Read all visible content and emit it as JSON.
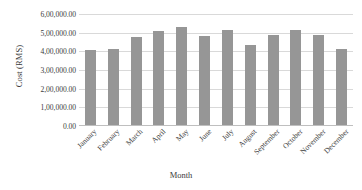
{
  "chart_data": {
    "type": "bar",
    "title": "",
    "xlabel": "Month",
    "ylabel": "Cost (RMS)",
    "categories": [
      "January",
      "February",
      "March",
      "April",
      "May",
      "June",
      "July",
      "August",
      "September",
      "October",
      "November",
      "December"
    ],
    "values": [
      405000,
      415000,
      475000,
      510000,
      530000,
      482000,
      512000,
      435000,
      488000,
      517000,
      490000,
      410000
    ],
    "ylim": [
      0,
      600000
    ],
    "ytick_values": [
      0,
      100000,
      200000,
      300000,
      400000,
      500000,
      600000
    ],
    "ytick_labels": [
      "0.00",
      "1,00,000.00",
      "2,00,000.00",
      "3,00,000.00",
      "4,00,000.00",
      "5,00,000.00",
      "6,00,000.00"
    ],
    "grid": true,
    "legend": "none",
    "bar_color": "#969696",
    "gridline_color": "#d9d9d9",
    "text_color": "#3b3b3b"
  }
}
